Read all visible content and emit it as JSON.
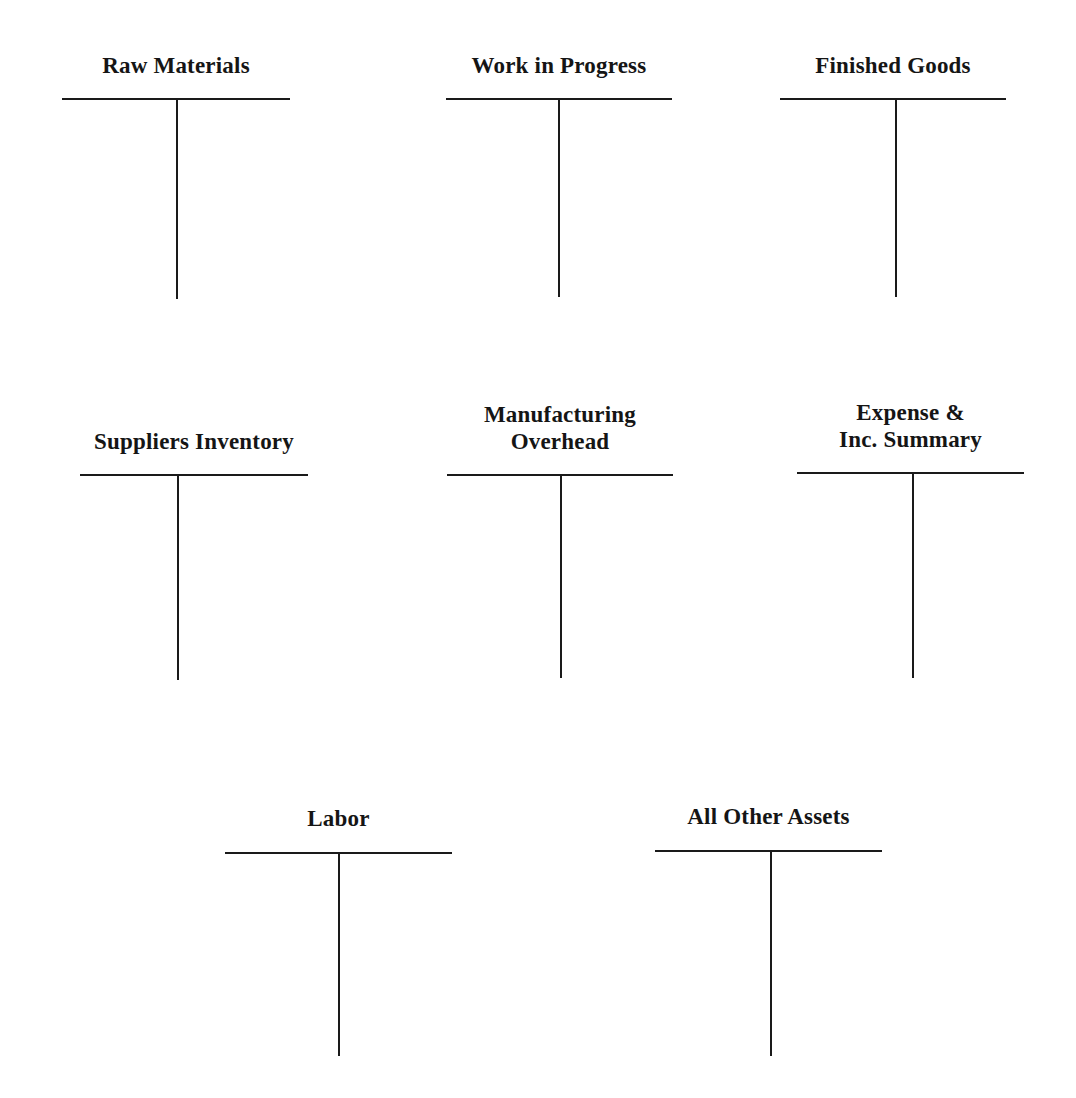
{
  "page": {
    "background_color": "#ffffff",
    "ink_color": "#1a1a1a",
    "width": 1076,
    "height": 1098
  },
  "accounts": [
    {
      "id": "raw-materials",
      "label": "Raw Materials",
      "label_lines": [
        "Raw Materials"
      ],
      "row": 1,
      "column": 1,
      "rule_left": 62,
      "rule_width": 228,
      "rule_top": 98,
      "stem_x": 114,
      "stem_height": 201,
      "title_top": 52
    },
    {
      "id": "work-in-progress",
      "label": "Work in Progress",
      "label_lines": [
        "Work in Progress"
      ],
      "row": 1,
      "column": 2,
      "rule_left": 446,
      "rule_width": 226,
      "rule_top": 98,
      "stem_x": 112,
      "stem_height": 199,
      "title_top": 52
    },
    {
      "id": "finished-goods",
      "label": "Finished Goods",
      "label_lines": [
        "Finished Goods"
      ],
      "row": 1,
      "column": 3,
      "rule_left": 780,
      "rule_width": 226,
      "rule_top": 98,
      "stem_x": 115,
      "stem_height": 199,
      "title_top": 52
    },
    {
      "id": "suppliers-inventory",
      "label": "Suppliers Inventory",
      "label_lines": [
        "Suppliers Inventory"
      ],
      "row": 2,
      "column": 1,
      "rule_left": 80,
      "rule_width": 228,
      "rule_top": 474,
      "stem_x": 97,
      "stem_height": 206,
      "title_top": 428
    },
    {
      "id": "manufacturing-overhead",
      "label": "Manufacturing Overhead",
      "label_lines": [
        "Manufacturing",
        "Overhead"
      ],
      "row": 2,
      "column": 2,
      "rule_left": 447,
      "rule_width": 226,
      "rule_top": 474,
      "stem_x": 113,
      "stem_height": 204,
      "title_top": 401
    },
    {
      "id": "expense-inc-summary",
      "label": "Expense & Inc. Summary",
      "label_lines": [
        "Expense &",
        "Inc. Summary"
      ],
      "row": 2,
      "column": 3,
      "rule_left": 797,
      "rule_width": 227,
      "rule_top": 472,
      "stem_x": 115,
      "stem_height": 206,
      "title_top": 399
    },
    {
      "id": "labor",
      "label": "Labor",
      "label_lines": [
        "Labor"
      ],
      "row": 3,
      "column": 2,
      "rule_left": 225,
      "rule_width": 227,
      "rule_top": 852,
      "stem_x": 113,
      "stem_height": 204,
      "title_top": 805
    },
    {
      "id": "all-other-assets",
      "label": "All Other Assets",
      "label_lines": [
        "All Other Assets"
      ],
      "row": 3,
      "column": 3,
      "rule_left": 655,
      "rule_width": 227,
      "rule_top": 850,
      "stem_x": 115,
      "stem_height": 206,
      "title_top": 803
    }
  ]
}
